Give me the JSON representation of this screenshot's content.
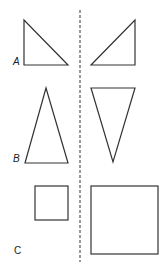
{
  "diagram": {
    "type": "reflection-across-line",
    "axis": {
      "style": "dashed",
      "x": 80,
      "y1": 10,
      "y2": 262,
      "color": "#333333"
    },
    "stroke_color": "#333333",
    "rows": [
      {
        "label": "A",
        "left_shape": {
          "kind": "right-triangle",
          "points": [
            [
              24,
              20
            ],
            [
              24,
              65
            ],
            [
              68,
              65
            ]
          ]
        },
        "right_shape": {
          "kind": "right-triangle-mirrored",
          "points": [
            [
              135,
              20
            ],
            [
              135,
              65
            ],
            [
              91,
              65
            ]
          ]
        }
      },
      {
        "label": "B",
        "left_shape": {
          "kind": "isosceles-triangle-up",
          "points": [
            [
              46,
              88
            ],
            [
              25,
              163
            ],
            [
              68,
              163
            ]
          ]
        },
        "right_shape": {
          "kind": "isosceles-triangle-down",
          "points": [
            [
              91,
              88
            ],
            [
              135,
              88
            ],
            [
              113,
              162
            ]
          ]
        }
      },
      {
        "label": "C",
        "left_shape": {
          "kind": "small-square",
          "x": 35,
          "y": 186,
          "w": 33,
          "h": 34
        },
        "right_shape": {
          "kind": "large-square",
          "x": 91,
          "y": 186,
          "w": 67,
          "h": 68
        }
      }
    ]
  }
}
